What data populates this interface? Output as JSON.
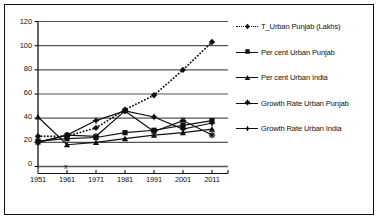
{
  "chart_data": {
    "type": "line",
    "title": "",
    "xlabel": "",
    "ylabel": "",
    "x": [
      "1951",
      "1961",
      "1971",
      "1981",
      "1991",
      "2001",
      "2011"
    ],
    "ylim": [
      0,
      120
    ],
    "yticks": [
      0,
      20,
      40,
      60,
      80,
      100,
      120
    ],
    "grid": true,
    "legend_position": "right",
    "annotations": [
      {
        "text": "x",
        "x": "1961",
        "y": 9
      }
    ],
    "series": [
      {
        "name": "T_Urban Punjab (Lakhs)",
        "marker": "diamond",
        "linestyle": "dotted",
        "values": [
          25,
          25,
          32,
          47,
          59,
          80,
          103
        ]
      },
      {
        "name": "Per cent Urban Punjab",
        "marker": "square",
        "linestyle": "solid",
        "values": [
          21,
          23,
          24,
          28,
          30,
          34,
          38
        ]
      },
      {
        "name": "Per cent Urban India",
        "marker": "triangle",
        "linestyle": "solid",
        "values": [
          41,
          18,
          20,
          23,
          26,
          28,
          31
        ]
      },
      {
        "name": "Growth Rate Urban Punjab",
        "marker": "cross",
        "linestyle": "solid",
        "values": [
          20,
          26,
          25,
          46,
          29,
          38,
          26
        ]
      },
      {
        "name": "Growth Rate Urban India",
        "marker": "dot",
        "linestyle": "solid",
        "values": [
          20,
          26,
          38,
          46,
          41,
          31,
          36
        ]
      }
    ]
  },
  "legend": {
    "items": [
      {
        "label": "T_Urban Punjab (Lakhs)",
        "icon": "diamond-marker-icon"
      },
      {
        "label": "Per cent Urban Punjab",
        "icon": "square-marker-icon"
      },
      {
        "label": "Per cent Urban India",
        "icon": "triangle-marker-icon"
      },
      {
        "label": "Growth Rate Urban Punjab",
        "icon": "cross-marker-icon"
      },
      {
        "label": "Growth Rate Urban India",
        "icon": "dot-marker-icon"
      }
    ]
  },
  "axes": {
    "y_labels": [
      "120",
      "100",
      "80",
      "60",
      "40",
      "20",
      "0"
    ],
    "x_labels": [
      "1951",
      "1961",
      "1971",
      "1981",
      "1991",
      "2001",
      "2011"
    ]
  },
  "colors": {
    "line": "#111111",
    "grid": "#555555",
    "frame": "#111111",
    "background": "#ffffff"
  }
}
